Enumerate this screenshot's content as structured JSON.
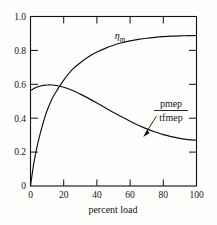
{
  "chart_data": {
    "type": "line",
    "title": "",
    "subtitle": "",
    "xlabel": "percent load",
    "ylabel": "",
    "xlim": [
      0,
      100
    ],
    "ylim": [
      0,
      1.0
    ],
    "grid": false,
    "legend_position": "inline-annotations",
    "xticks": [
      0,
      20,
      40,
      60,
      80,
      100
    ],
    "xtick_labels": [
      "0",
      "20",
      "40",
      "60",
      "80",
      "100"
    ],
    "yticks": [
      0,
      0.2,
      0.4,
      0.6,
      0.8,
      1.0
    ],
    "ytick_labels": [
      "0",
      "0.2",
      "0.4",
      "0.6",
      "0.8",
      "1.0"
    ],
    "annotations": [
      {
        "name": "eta-m-label",
        "text": "η",
        "subscript": "m",
        "x": 47,
        "y": 0.875,
        "description": "mechanical efficiency curve label"
      },
      {
        "name": "pmep-tfmep-label",
        "numerator": "pmep",
        "denominator": "tfmep",
        "x": 78,
        "y": 0.6,
        "description": "pmep over tfmep ratio curve label with leader arrow"
      }
    ],
    "series": [
      {
        "name": "η_m",
        "label": "eta_m",
        "color": "#101010",
        "x": [
          0,
          2,
          4,
          6,
          8,
          10,
          13,
          16,
          20,
          25,
          30,
          35,
          40,
          45,
          50,
          55,
          60,
          65,
          70,
          75,
          80,
          85,
          90,
          95,
          100
        ],
        "values": [
          0.0,
          0.135,
          0.235,
          0.315,
          0.385,
          0.445,
          0.515,
          0.565,
          0.625,
          0.685,
          0.727,
          0.762,
          0.79,
          0.812,
          0.83,
          0.845,
          0.856,
          0.865,
          0.872,
          0.877,
          0.881,
          0.884,
          0.886,
          0.887,
          0.888
        ]
      },
      {
        "name": "pmep/tfmep",
        "label": "pmep_over_tfmep",
        "color": "#101010",
        "x": [
          0,
          2,
          4,
          6,
          8,
          10,
          13,
          16,
          20,
          25,
          30,
          35,
          40,
          45,
          50,
          55,
          60,
          65,
          70,
          75,
          80,
          85,
          90,
          95,
          100
        ],
        "values": [
          0.562,
          0.575,
          0.584,
          0.59,
          0.594,
          0.596,
          0.596,
          0.592,
          0.583,
          0.565,
          0.542,
          0.517,
          0.49,
          0.462,
          0.434,
          0.408,
          0.382,
          0.358,
          0.337,
          0.319,
          0.303,
          0.291,
          0.281,
          0.274,
          0.27
        ]
      }
    ],
    "crossing_point": {
      "x": 22,
      "y": 0.58
    }
  }
}
